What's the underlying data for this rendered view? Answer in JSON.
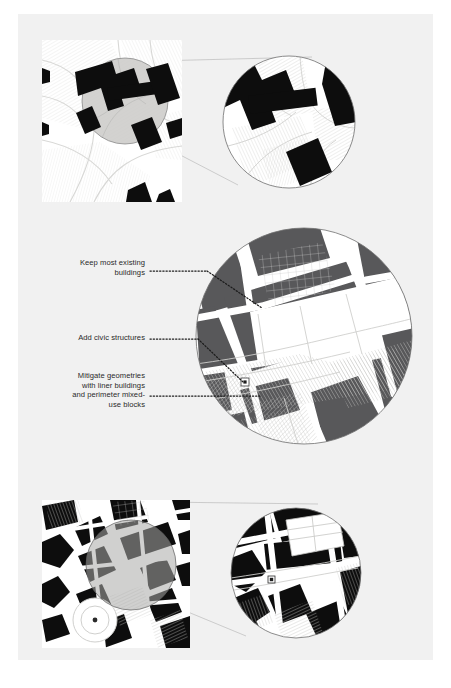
{
  "figure": {
    "kind": "urban-design-diagram",
    "colors": {
      "page": "#f1f1f1",
      "paper_white": "#ffffff",
      "building_black": "#0d0d0d",
      "building_gray": "#58585a",
      "highlight_gray": "#d3d2d0",
      "hatch_gray": "#c9c9c7",
      "outline_gray": "#8a8a8a",
      "leader_gray": "#a9a9a9",
      "text": "#2a2a2a"
    }
  },
  "panels": [
    {
      "id": "existing-conditions",
      "position": "top",
      "source_label": "site-plan-square-existing",
      "detail_label": "zoom-circle-existing"
    },
    {
      "id": "proposed-strategy",
      "position": "middle",
      "source_label": "zoom-circle-proposed"
    },
    {
      "id": "figure-ground",
      "position": "bottom",
      "source_label": "site-plan-square-figureground",
      "detail_label": "zoom-circle-figureground"
    }
  ],
  "annotations": [
    {
      "id": "keep-existing",
      "text": "Keep most existing\nbuildings",
      "leader": "dotted"
    },
    {
      "id": "add-civic",
      "text": "Add civic structures",
      "leader": "dotted"
    },
    {
      "id": "mitigate-geometries",
      "text": "Mitigate geometries\nwith liner buildings\nand perimeter mixed-\nuse blocks",
      "leader": "dotted"
    }
  ]
}
